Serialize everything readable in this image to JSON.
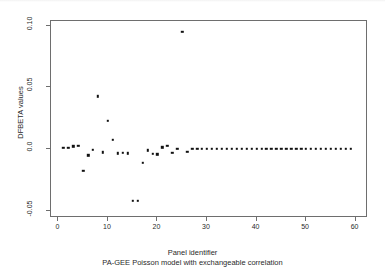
{
  "chart_data": {
    "type": "scatter",
    "title": "",
    "xlabel": "Panel identifier",
    "sublabel": "PA-GEE Poisson model with exchangeable correlation",
    "ylabel": "DFBETA values",
    "xlim": [
      -1.5,
      62.5
    ],
    "ylim": [
      -0.056,
      0.104
    ],
    "xticks": [
      0,
      10,
      20,
      30,
      40,
      50,
      60
    ],
    "xtick_labels": [
      "0",
      "10",
      "20",
      "30",
      "40",
      "50",
      "60"
    ],
    "yticks": [
      0.1,
      0.05,
      0.0,
      -0.05
    ],
    "ytick_labels": [
      "0.10",
      "0.05",
      "0.0",
      "-0.05"
    ],
    "grid": false,
    "legend": null,
    "marker": "filled-square",
    "marker_color": "#111111",
    "frame_color": "#6e6e6e",
    "background": "#ffffff",
    "x": [
      1,
      2,
      3,
      4,
      5,
      6,
      7,
      8,
      9,
      10,
      11,
      12,
      13,
      14,
      15,
      16,
      17,
      18,
      19,
      20,
      21,
      22,
      23,
      24,
      25,
      26,
      27,
      28,
      29,
      30,
      31,
      32,
      33,
      34,
      35,
      36,
      37,
      38,
      39,
      40,
      41,
      42,
      43,
      44,
      45,
      46,
      47,
      48,
      49,
      50,
      51,
      52,
      53,
      54,
      55,
      56,
      57,
      58,
      59
    ],
    "y": [
      0.0008,
      0.0012,
      0.0022,
      0.0024,
      -0.0175,
      -0.0052,
      -0.0006,
      0.0428,
      -0.0026,
      0.0228,
      0.0073,
      -0.0035,
      -0.003,
      -0.0034,
      -0.0422,
      -0.042,
      -0.0112,
      -0.001,
      -0.0038,
      -0.0044,
      0.0014,
      0.0028,
      -0.0032,
      0.0,
      0.095,
      -0.002,
      0.0,
      0.0002,
      0.0002,
      0.0002,
      0.0002,
      0.0002,
      0.0002,
      0.0002,
      0.0002,
      0.0002,
      0.0002,
      0.0002,
      0.0002,
      0.0002,
      0.0002,
      0.0002,
      0.0002,
      0.0002,
      0.0002,
      0.0002,
      0.0002,
      0.0002,
      0.0002,
      0.0002,
      0.0002,
      0.0002,
      0.0002,
      0.0002,
      0.0002,
      0.0002,
      0.0002,
      0.0002,
      0.0002
    ]
  }
}
